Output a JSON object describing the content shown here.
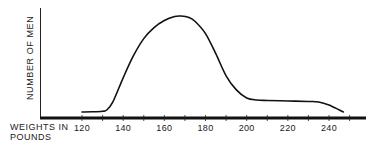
{
  "chart_data": {
    "type": "line",
    "title": "",
    "xlabel": "WEIGHTS IN POUNDS",
    "xlabel_lines": [
      "WEIGHTS IN",
      "POUNDS"
    ],
    "ylabel": "NUMBER OF MEN",
    "x_ticks": [
      120,
      140,
      160,
      180,
      200,
      220,
      240
    ],
    "x_tick_labels": [
      "120",
      "140",
      "160",
      "180",
      "200",
      "220",
      "240"
    ],
    "xlim": [
      106,
      256
    ],
    "y_ticks": [],
    "grid": false,
    "legend": null,
    "series": [
      {
        "name": "Distribution of weights",
        "x": [
          120,
          125,
          130,
          132,
          135,
          140,
          145,
          150,
          155,
          160,
          165,
          168,
          172,
          175,
          180,
          185,
          190,
          195,
          200,
          205,
          210,
          220,
          230,
          235,
          240,
          245,
          247
        ],
        "y": [
          2,
          2.2,
          2.8,
          4,
          12,
          36,
          58,
          75,
          86,
          93,
          97,
          97.5,
          96,
          92,
          80,
          60,
          38,
          24,
          16,
          14,
          13.5,
          13,
          12.5,
          12,
          9,
          4,
          2
        ]
      }
    ],
    "ylim": [
      0,
      100
    ],
    "color": "#111111"
  }
}
